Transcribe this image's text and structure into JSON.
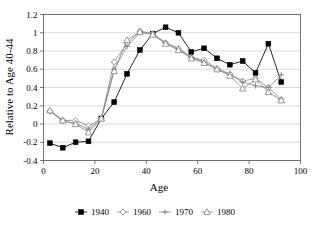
{
  "chart_data": {
    "type": "line",
    "title": "",
    "xlabel": "Age",
    "ylabel": "Relative to Age 40-44",
    "xlim": [
      0,
      100
    ],
    "ylim": [
      -0.4,
      1.2
    ],
    "xticks": [
      0,
      20,
      40,
      60,
      80,
      100
    ],
    "yticks": [
      -0.4,
      -0.2,
      0,
      0.2,
      0.4,
      0.6,
      0.8,
      1,
      1.2
    ],
    "xtick_labels": [
      "0",
      "20",
      "40",
      "60",
      "80",
      "100"
    ],
    "ytick_labels": [
      "-0.4",
      "-0.2",
      "0",
      "0.2",
      "0.4",
      "0.6",
      "0.8",
      "1",
      "1.2"
    ],
    "grid": "horizontal",
    "legend_position": "bottom",
    "x": [
      2.5,
      7.5,
      12.5,
      17.5,
      22.5,
      27.5,
      32.5,
      37.5,
      42.5,
      47.5,
      52.5,
      57.5,
      62.5,
      67.5,
      72.5,
      77.5,
      82.5,
      87.5,
      92.5
    ],
    "series": [
      {
        "name": "1940",
        "marker": "filled-square",
        "color": "#000000",
        "values": [
          -0.21,
          -0.26,
          -0.2,
          -0.19,
          0.06,
          0.24,
          0.55,
          0.81,
          0.99,
          1.06,
          1.0,
          0.79,
          0.83,
          0.72,
          0.65,
          0.69,
          0.56,
          0.88,
          0.46
        ]
      },
      {
        "name": "1960",
        "marker": "open-diamond",
        "color": "#808080",
        "values": [
          0.14,
          0.04,
          0.04,
          -0.02,
          0.06,
          0.68,
          0.88,
          1.02,
          0.99,
          0.89,
          0.83,
          0.73,
          0.7,
          0.61,
          0.55,
          0.47,
          0.5,
          0.4,
          0.27
        ]
      },
      {
        "name": "1970",
        "marker": "plus",
        "color": "#808080",
        "values": [
          0.14,
          0.03,
          0.01,
          -0.06,
          0.06,
          0.6,
          0.85,
          1.0,
          0.99,
          0.89,
          0.82,
          0.73,
          0.68,
          0.6,
          0.54,
          0.46,
          0.42,
          0.4,
          0.54
        ]
      },
      {
        "name": "1980",
        "marker": "open-triangle",
        "color": "#808080",
        "values": [
          0.15,
          0.04,
          0.0,
          -0.09,
          0.06,
          0.58,
          0.92,
          1.01,
          0.98,
          0.88,
          0.81,
          0.72,
          0.67,
          0.6,
          0.53,
          0.39,
          0.49,
          0.35,
          0.26
        ]
      }
    ]
  },
  "legend": {
    "entries": [
      {
        "label": "1940"
      },
      {
        "label": "1960"
      },
      {
        "label": "1970"
      },
      {
        "label": "1980"
      }
    ]
  },
  "colors": {
    "series_1940": "#000000",
    "series_other": "#7a7a7a",
    "grid": "#c8c8c8",
    "axis": "#555555",
    "background": "#ffffff"
  }
}
